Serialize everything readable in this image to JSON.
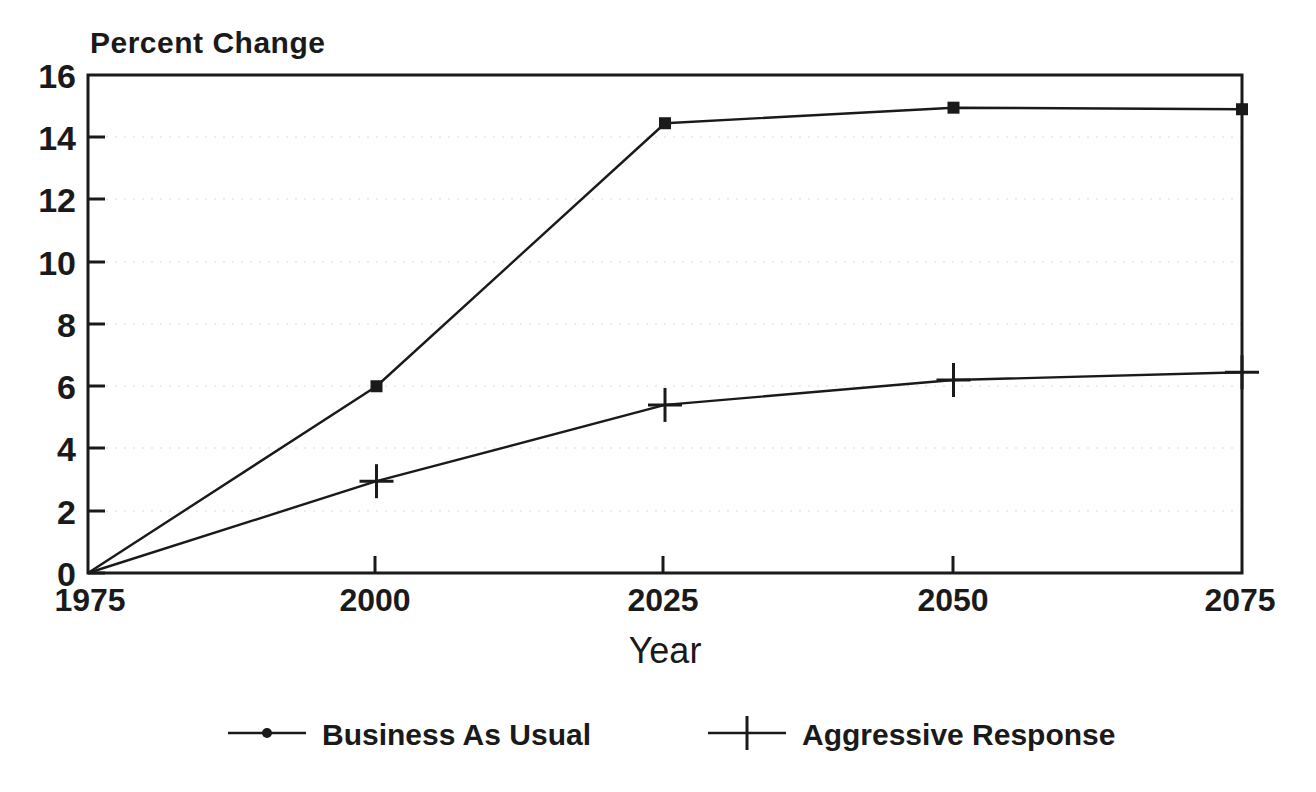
{
  "chart_data": {
    "type": "line",
    "title": "",
    "ylabel": "Percent Change",
    "xlabel": "Year",
    "x": [
      1975,
      2000,
      2025,
      2050,
      2075
    ],
    "xtick_labels": [
      "1975",
      "2000",
      "2025",
      "2050",
      "2075"
    ],
    "ytick_labels": [
      "0",
      "2",
      "4",
      "6",
      "8",
      "10",
      "12",
      "14",
      "16"
    ],
    "ytick_values": [
      0,
      2,
      4,
      6,
      8,
      10,
      12,
      14,
      16
    ],
    "xlim": [
      1975,
      2075
    ],
    "ylim": [
      0,
      16
    ],
    "grid": true,
    "legend_position": "below",
    "series": [
      {
        "name": "Business As Usual",
        "marker": "dot",
        "values": [
          0,
          6.0,
          14.45,
          14.95,
          14.9
        ]
      },
      {
        "name": "Aggressive Response",
        "marker": "plus",
        "values": [
          0,
          2.95,
          5.4,
          6.2,
          6.45
        ]
      }
    ],
    "colors": {
      "line": "#1a1a1a",
      "axis": "#1a1a1a",
      "grid": "#bdbdbd",
      "background": "#ffffff"
    }
  },
  "legend": {
    "items": [
      {
        "label": "Business As Usual",
        "marker": "dot"
      },
      {
        "label": "Aggressive Response",
        "marker": "plus"
      }
    ]
  }
}
